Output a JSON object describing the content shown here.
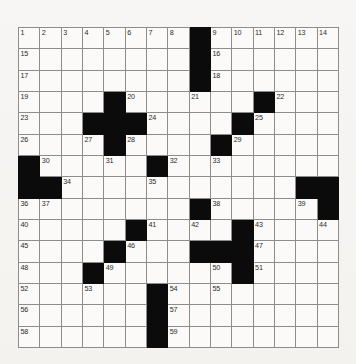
{
  "puzzle": {
    "title": "crossword-grid",
    "rows": 15,
    "columns": 15,
    "colors": {
      "paper": "#f6f5f3",
      "cell": "#fbfaf8",
      "block": "#0b0b0b",
      "gridline": "#8d8d8d",
      "number": "#2a2a2a"
    },
    "grid": [
      [
        {
          "n": "1",
          "block": false
        },
        {
          "n": "2",
          "block": false
        },
        {
          "n": "3",
          "block": false
        },
        {
          "n": "4",
          "block": false
        },
        {
          "n": "5",
          "block": false
        },
        {
          "n": "6",
          "block": false
        },
        {
          "n": "7",
          "block": false
        },
        {
          "n": "8",
          "block": false
        },
        {
          "n": "",
          "block": true
        },
        {
          "n": "9",
          "block": false
        },
        {
          "n": "10",
          "block": false
        },
        {
          "n": "11",
          "block": false
        },
        {
          "n": "12",
          "block": false
        },
        {
          "n": "13",
          "block": false
        },
        {
          "n": "14",
          "block": false
        }
      ],
      [
        {
          "n": "15",
          "block": false
        },
        {
          "n": "",
          "block": false
        },
        {
          "n": "",
          "block": false
        },
        {
          "n": "",
          "block": false
        },
        {
          "n": "",
          "block": false
        },
        {
          "n": "",
          "block": false
        },
        {
          "n": "",
          "block": false
        },
        {
          "n": "",
          "block": false
        },
        {
          "n": "",
          "block": true
        },
        {
          "n": "16",
          "block": false
        },
        {
          "n": "",
          "block": false
        },
        {
          "n": "",
          "block": false
        },
        {
          "n": "",
          "block": false
        },
        {
          "n": "",
          "block": false
        },
        {
          "n": "",
          "block": false
        }
      ],
      [
        {
          "n": "17",
          "block": false
        },
        {
          "n": "",
          "block": false
        },
        {
          "n": "",
          "block": false
        },
        {
          "n": "",
          "block": false
        },
        {
          "n": "",
          "block": false
        },
        {
          "n": "",
          "block": false
        },
        {
          "n": "",
          "block": false
        },
        {
          "n": "",
          "block": false
        },
        {
          "n": "",
          "block": true
        },
        {
          "n": "18",
          "block": false
        },
        {
          "n": "",
          "block": false
        },
        {
          "n": "",
          "block": false
        },
        {
          "n": "",
          "block": false
        },
        {
          "n": "",
          "block": false
        },
        {
          "n": "",
          "block": false
        }
      ],
      [
        {
          "n": "19",
          "block": false
        },
        {
          "n": "",
          "block": false
        },
        {
          "n": "",
          "block": false
        },
        {
          "n": "",
          "block": false
        },
        {
          "n": "",
          "block": true
        },
        {
          "n": "20",
          "block": false
        },
        {
          "n": "",
          "block": false
        },
        {
          "n": "",
          "block": false
        },
        {
          "n": "21",
          "block": false
        },
        {
          "n": "",
          "block": false
        },
        {
          "n": "",
          "block": false
        },
        {
          "n": "",
          "block": true
        },
        {
          "n": "22",
          "block": false
        },
        {
          "n": "",
          "block": false
        },
        {
          "n": "",
          "block": false
        }
      ],
      [
        {
          "n": "23",
          "block": false
        },
        {
          "n": "",
          "block": false
        },
        {
          "n": "",
          "block": false
        },
        {
          "n": "",
          "block": true
        },
        {
          "n": "",
          "block": true
        },
        {
          "n": "",
          "block": true
        },
        {
          "n": "24",
          "block": false
        },
        {
          "n": "",
          "block": false
        },
        {
          "n": "",
          "block": false
        },
        {
          "n": "",
          "block": false
        },
        {
          "n": "",
          "block": true
        },
        {
          "n": "25",
          "block": false
        },
        {
          "n": "",
          "block": false
        },
        {
          "n": "",
          "block": false
        },
        {
          "n": "",
          "block": false
        }
      ],
      [
        {
          "n": "26",
          "block": false
        },
        {
          "n": "",
          "block": false
        },
        {
          "n": "",
          "block": false
        },
        {
          "n": "27",
          "block": false
        },
        {
          "n": "",
          "block": true
        },
        {
          "n": "28",
          "block": false
        },
        {
          "n": "",
          "block": false
        },
        {
          "n": "",
          "block": false
        },
        {
          "n": "",
          "block": false
        },
        {
          "n": "",
          "block": true
        },
        {
          "n": "29",
          "block": false
        },
        {
          "n": "",
          "block": false
        },
        {
          "n": "",
          "block": false
        },
        {
          "n": "",
          "block": false
        },
        {
          "n": "",
          "block": false
        }
      ],
      [
        {
          "n": "",
          "block": true
        },
        {
          "n": "30",
          "block": false
        },
        {
          "n": "",
          "block": false
        },
        {
          "n": "",
          "block": false
        },
        {
          "n": "31",
          "block": false
        },
        {
          "n": "",
          "block": false
        },
        {
          "n": "",
          "block": true
        },
        {
          "n": "32",
          "block": false
        },
        {
          "n": "",
          "block": false
        },
        {
          "n": "33",
          "block": false
        },
        {
          "n": "",
          "block": false
        },
        {
          "n": "",
          "block": false
        },
        {
          "n": "",
          "block": false
        },
        {
          "n": "",
          "block": false
        },
        {
          "n": "",
          "block": false
        }
      ],
      [
        {
          "n": "",
          "block": true
        },
        {
          "n": "",
          "block": true
        },
        {
          "n": "34",
          "block": false
        },
        {
          "n": "",
          "block": false
        },
        {
          "n": "",
          "block": false
        },
        {
          "n": "",
          "block": false
        },
        {
          "n": "35",
          "block": false
        },
        {
          "n": "",
          "block": false
        },
        {
          "n": "",
          "block": false
        },
        {
          "n": "",
          "block": false
        },
        {
          "n": "",
          "block": false
        },
        {
          "n": "",
          "block": false
        },
        {
          "n": "",
          "block": false
        },
        {
          "n": "",
          "block": true
        },
        {
          "n": "",
          "block": true
        }
      ],
      [
        {
          "n": "36",
          "block": false
        },
        {
          "n": "37",
          "block": false
        },
        {
          "n": "",
          "block": false
        },
        {
          "n": "",
          "block": false
        },
        {
          "n": "",
          "block": false
        },
        {
          "n": "",
          "block": false
        },
        {
          "n": "",
          "block": false
        },
        {
          "n": "",
          "block": false
        },
        {
          "n": "",
          "block": true
        },
        {
          "n": "38",
          "block": false
        },
        {
          "n": "",
          "block": false
        },
        {
          "n": "",
          "block": false
        },
        {
          "n": "",
          "block": false
        },
        {
          "n": "39",
          "block": false
        },
        {
          "n": "",
          "block": true
        }
      ],
      [
        {
          "n": "40",
          "block": false
        },
        {
          "n": "",
          "block": false
        },
        {
          "n": "",
          "block": false
        },
        {
          "n": "",
          "block": false
        },
        {
          "n": "",
          "block": false
        },
        {
          "n": "",
          "block": true
        },
        {
          "n": "41",
          "block": false
        },
        {
          "n": "",
          "block": false
        },
        {
          "n": "42",
          "block": false
        },
        {
          "n": "",
          "block": false
        },
        {
          "n": "",
          "block": true
        },
        {
          "n": "43",
          "block": false
        },
        {
          "n": "",
          "block": false
        },
        {
          "n": "",
          "block": false
        },
        {
          "n": "44",
          "block": false
        }
      ],
      [
        {
          "n": "45",
          "block": false
        },
        {
          "n": "",
          "block": false
        },
        {
          "n": "",
          "block": false
        },
        {
          "n": "",
          "block": false
        },
        {
          "n": "",
          "block": true
        },
        {
          "n": "46",
          "block": false
        },
        {
          "n": "",
          "block": false
        },
        {
          "n": "",
          "block": false
        },
        {
          "n": "",
          "block": true
        },
        {
          "n": "",
          "block": true
        },
        {
          "n": "",
          "block": true
        },
        {
          "n": "47",
          "block": false
        },
        {
          "n": "",
          "block": false
        },
        {
          "n": "",
          "block": false
        },
        {
          "n": "",
          "block": false
        }
      ],
      [
        {
          "n": "48",
          "block": false
        },
        {
          "n": "",
          "block": false
        },
        {
          "n": "",
          "block": false
        },
        {
          "n": "",
          "block": true
        },
        {
          "n": "49",
          "block": false
        },
        {
          "n": "",
          "block": false
        },
        {
          "n": "",
          "block": false
        },
        {
          "n": "",
          "block": false
        },
        {
          "n": "",
          "block": false
        },
        {
          "n": "50",
          "block": false
        },
        {
          "n": "",
          "block": true
        },
        {
          "n": "51",
          "block": false
        },
        {
          "n": "",
          "block": false
        },
        {
          "n": "",
          "block": false
        },
        {
          "n": "",
          "block": false
        }
      ],
      [
        {
          "n": "52",
          "block": false
        },
        {
          "n": "",
          "block": false
        },
        {
          "n": "",
          "block": false
        },
        {
          "n": "53",
          "block": false
        },
        {
          "n": "",
          "block": false
        },
        {
          "n": "",
          "block": false
        },
        {
          "n": "",
          "block": true
        },
        {
          "n": "54",
          "block": false
        },
        {
          "n": "",
          "block": false
        },
        {
          "n": "55",
          "block": false
        },
        {
          "n": "",
          "block": false
        },
        {
          "n": "",
          "block": false
        },
        {
          "n": "",
          "block": false
        },
        {
          "n": "",
          "block": false
        },
        {
          "n": "",
          "block": false
        }
      ],
      [
        {
          "n": "56",
          "block": false
        },
        {
          "n": "",
          "block": false
        },
        {
          "n": "",
          "block": false
        },
        {
          "n": "",
          "block": false
        },
        {
          "n": "",
          "block": false
        },
        {
          "n": "",
          "block": false
        },
        {
          "n": "",
          "block": true
        },
        {
          "n": "57",
          "block": false
        },
        {
          "n": "",
          "block": false
        },
        {
          "n": "",
          "block": false
        },
        {
          "n": "",
          "block": false
        },
        {
          "n": "",
          "block": false
        },
        {
          "n": "",
          "block": false
        },
        {
          "n": "",
          "block": false
        },
        {
          "n": "",
          "block": false
        }
      ],
      [
        {
          "n": "58",
          "block": false
        },
        {
          "n": "",
          "block": false
        },
        {
          "n": "",
          "block": false
        },
        {
          "n": "",
          "block": false
        },
        {
          "n": "",
          "block": false
        },
        {
          "n": "",
          "block": false
        },
        {
          "n": "",
          "block": true
        },
        {
          "n": "59",
          "block": false
        },
        {
          "n": "",
          "block": false
        },
        {
          "n": "",
          "block": false
        },
        {
          "n": "",
          "block": false
        },
        {
          "n": "",
          "block": false
        },
        {
          "n": "",
          "block": false
        },
        {
          "n": "",
          "block": false
        },
        {
          "n": "",
          "block": false
        }
      ]
    ]
  }
}
